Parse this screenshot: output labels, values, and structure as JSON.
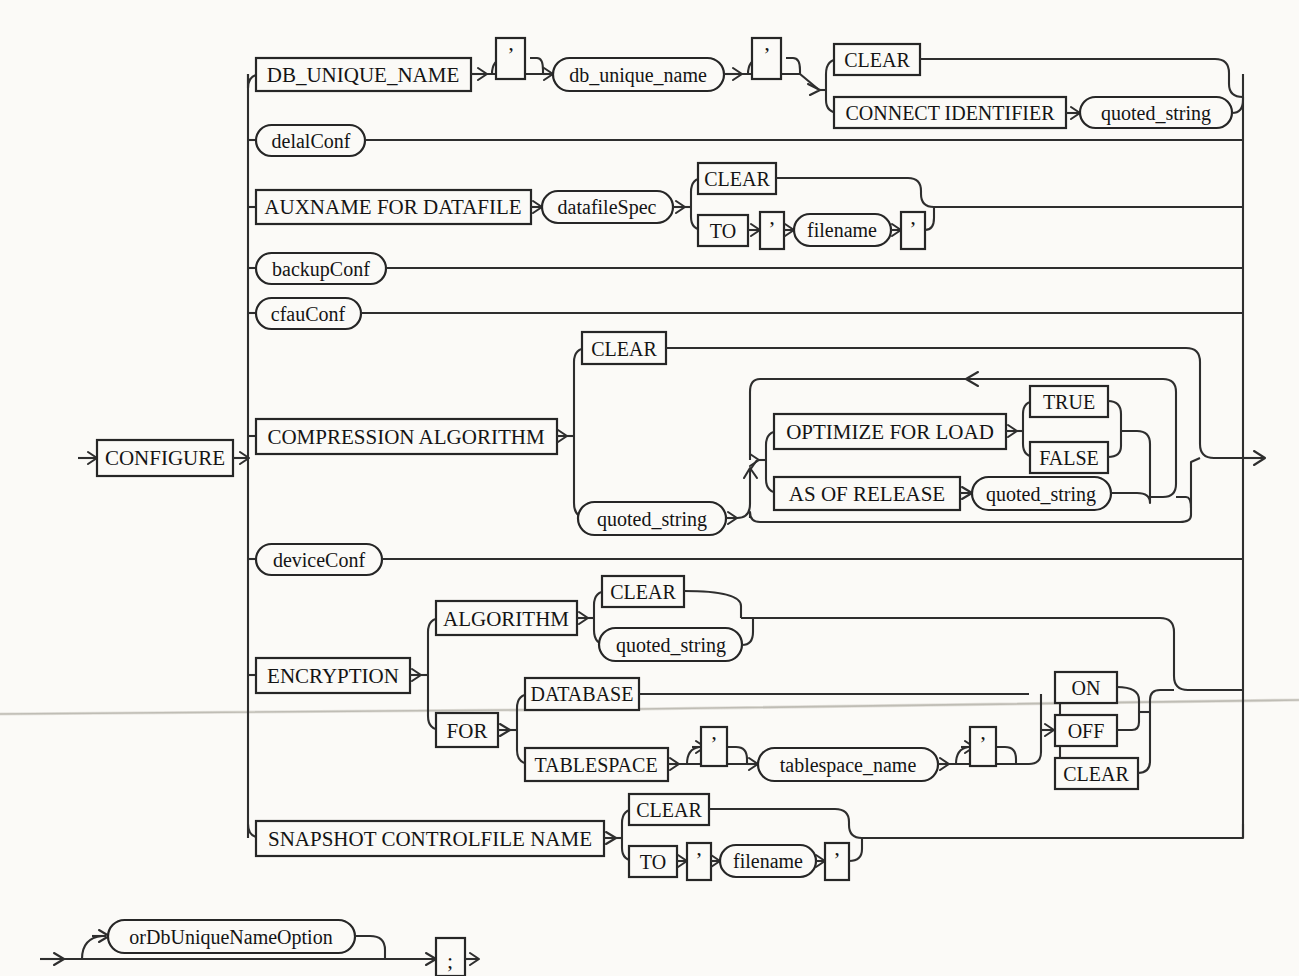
{
  "diagram": {
    "type": "railroad-syntax-diagram",
    "title": "CONFIGURE",
    "entry_symbol": "→",
    "exit_symbol": "→",
    "colors": {
      "ink": "#262626",
      "background": "#fbfaf7",
      "fold_line": "#b9b6ae"
    },
    "start": {
      "label": "CONFIGURE",
      "shape": "box"
    },
    "branches": [
      {
        "id": "db-unique-name",
        "items": [
          {
            "label": "DB_UNIQUE_NAME",
            "shape": "box"
          },
          {
            "label": "'",
            "shape": "box",
            "kind": "quote",
            "optional_loop": true
          },
          {
            "label": "db_unique_name",
            "shape": "oval"
          },
          {
            "label": "'",
            "shape": "box",
            "kind": "quote"
          }
        ],
        "choice": [
          {
            "label": "CLEAR",
            "shape": "box"
          },
          {
            "label": "CONNECT IDENTIFIER",
            "shape": "box",
            "follow": {
              "label": "quoted_string",
              "shape": "oval"
            }
          }
        ]
      },
      {
        "id": "delal-conf",
        "items": [
          {
            "label": "delalConf",
            "shape": "oval"
          }
        ]
      },
      {
        "id": "auxname-for-datafile",
        "items": [
          {
            "label": "AUXNAME FOR DATAFILE",
            "shape": "box"
          },
          {
            "label": "datafileSpec",
            "shape": "oval"
          }
        ],
        "choice": [
          {
            "label": "CLEAR",
            "shape": "box"
          },
          {
            "label": "TO",
            "shape": "box",
            "follow_seq": [
              {
                "label": "'",
                "shape": "box",
                "kind": "quote"
              },
              {
                "label": "filename",
                "shape": "oval"
              },
              {
                "label": "'",
                "shape": "box",
                "kind": "quote"
              }
            ]
          }
        ]
      },
      {
        "id": "backup-conf",
        "items": [
          {
            "label": "backupConf",
            "shape": "oval"
          }
        ]
      },
      {
        "id": "cfau-conf",
        "items": [
          {
            "label": "cfauConf",
            "shape": "oval"
          }
        ]
      },
      {
        "id": "compression-algorithm",
        "items": [
          {
            "label": "COMPRESSION ALGORITHM",
            "shape": "box"
          }
        ],
        "choice": [
          {
            "label": "CLEAR",
            "shape": "box"
          },
          {
            "label": "quoted_string",
            "shape": "oval",
            "follow_group": {
              "repeat": true,
              "options": [
                {
                  "label": "OPTIMIZE FOR LOAD",
                  "shape": "box",
                  "choice": [
                    {
                      "label": "TRUE",
                      "shape": "box"
                    },
                    {
                      "label": "FALSE",
                      "shape": "box"
                    }
                  ]
                },
                {
                  "label": "AS OF RELEASE",
                  "shape": "box",
                  "follow": {
                    "label": "quoted_string",
                    "shape": "oval"
                  }
                }
              ]
            }
          }
        ]
      },
      {
        "id": "device-conf",
        "items": [
          {
            "label": "deviceConf",
            "shape": "oval"
          }
        ]
      },
      {
        "id": "encryption",
        "items": [
          {
            "label": "ENCRYPTION",
            "shape": "box"
          }
        ],
        "choice": [
          {
            "label": "ALGORITHM",
            "shape": "box",
            "choice": [
              {
                "label": "CLEAR",
                "shape": "box"
              },
              {
                "label": "quoted_string",
                "shape": "oval"
              }
            ]
          },
          {
            "label": "FOR",
            "shape": "box",
            "choice": [
              {
                "label": "DATABASE",
                "shape": "box"
              },
              {
                "label": "TABLESPACE",
                "shape": "box",
                "follow_seq": [
                  {
                    "label": "'",
                    "shape": "box",
                    "kind": "quote",
                    "optional_loop": true
                  },
                  {
                    "label": "tablespace_name",
                    "shape": "oval"
                  },
                  {
                    "label": "'",
                    "shape": "box",
                    "kind": "quote",
                    "optional_loop": true
                  }
                ]
              }
            ],
            "tail_choice": [
              {
                "label": "ON",
                "shape": "box"
              },
              {
                "label": "OFF",
                "shape": "box"
              },
              {
                "label": "CLEAR",
                "shape": "box"
              }
            ]
          }
        ]
      },
      {
        "id": "snapshot-controlfile-name",
        "items": [
          {
            "label": "SNAPSHOT CONTROLFILE NAME",
            "shape": "box"
          }
        ],
        "choice": [
          {
            "label": "CLEAR",
            "shape": "box"
          },
          {
            "label": "TO",
            "shape": "box",
            "follow_seq": [
              {
                "label": "'",
                "shape": "box",
                "kind": "quote"
              },
              {
                "label": "filename",
                "shape": "oval"
              },
              {
                "label": "'",
                "shape": "box",
                "kind": "quote"
              }
            ]
          }
        ]
      }
    ],
    "tail_row": {
      "optional": {
        "label": "orDbUniqueNameOption",
        "shape": "oval"
      },
      "terminator": {
        "label": ";",
        "shape": "box"
      }
    }
  },
  "labels": {
    "configure": "CONFIGURE",
    "db_unique_name_kw": "DB_UNIQUE_NAME",
    "db_unique_name_nt": "db_unique_name",
    "clear": "CLEAR",
    "connect_identifier": "CONNECT IDENTIFIER",
    "quoted_string": "quoted_string",
    "delal_conf": "delalConf",
    "auxname_for_datafile": "AUXNAME FOR DATAFILE",
    "datafile_spec": "datafileSpec",
    "to": "TO",
    "filename": "filename",
    "backup_conf": "backupConf",
    "cfau_conf": "cfauConf",
    "compression_algorithm": "COMPRESSION ALGORITHM",
    "optimize_for_load": "OPTIMIZE FOR LOAD",
    "true": "TRUE",
    "false": "FALSE",
    "as_of_release": "AS OF RELEASE",
    "device_conf": "deviceConf",
    "encryption": "ENCRYPTION",
    "algorithm": "ALGORITHM",
    "for": "FOR",
    "database": "DATABASE",
    "tablespace": "TABLESPACE",
    "tablespace_name": "tablespace_name",
    "on": "ON",
    "off": "OFF",
    "snapshot_controlfile_name": "SNAPSHOT CONTROLFILE NAME",
    "or_db_unique_name_option": "orDbUniqueNameOption",
    "semicolon": ";",
    "apostrophe": "’"
  }
}
